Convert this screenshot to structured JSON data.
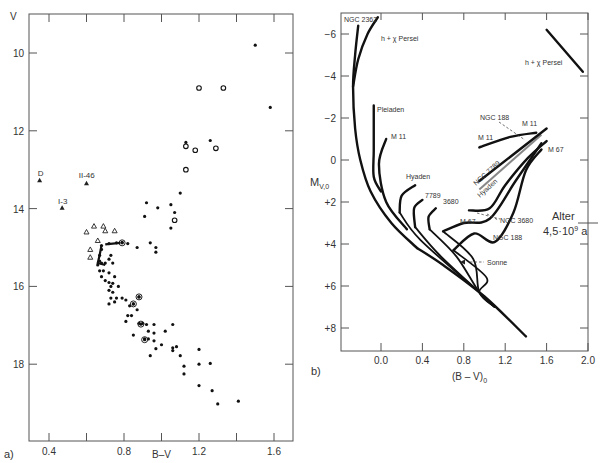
{
  "panels": {
    "a": {
      "label": "a)",
      "xlabel": "B–V",
      "ylabel": "V"
    },
    "b": {
      "label": "b)",
      "xlabel": "(B – V)",
      "xlabel_sub": "0",
      "ylabel": "M",
      "ylabel_sub": "V,0",
      "annotation_line1": "Alter",
      "annotation_line2": "4,5·10",
      "annotation_sup": "9",
      "annotation_unit": " a"
    }
  },
  "chart_data": [
    {
      "type": "scatter",
      "title": "a) Color-magnitude diagram",
      "xlabel": "B–V",
      "ylabel": "V",
      "xlim": [
        0.31,
        1.72
      ],
      "ylim": [
        20.0,
        9.0
      ],
      "y_inverted": true,
      "xticks": [
        0.4,
        0.6,
        0.8,
        1.0,
        1.2,
        1.4,
        1.6
      ],
      "xtick_labels": [
        "0.4",
        "",
        "0.8",
        "",
        "1.2",
        "",
        "1.6"
      ],
      "yticks": [
        10,
        12,
        14,
        16,
        18
      ],
      "ytick_labels": [
        "10",
        "12",
        "14",
        "16",
        "18"
      ],
      "grid": false,
      "annotations": [
        {
          "text": "D",
          "x": 0.35,
          "y": 13.3
        },
        {
          "text": "II-46",
          "x": 0.58,
          "y": 13.35
        },
        {
          "text": "I-3",
          "x": 0.48,
          "y": 14.0
        }
      ],
      "series": [
        {
          "name": "labeled triangles",
          "marker": "triangle-filled",
          "points": [
            [
              0.35,
              13.27
            ],
            [
              0.6,
              13.35
            ],
            [
              0.47,
              13.98
            ]
          ]
        },
        {
          "name": "open triangles",
          "marker": "triangle-open",
          "points": [
            [
              0.6,
              14.6
            ],
            [
              0.64,
              14.45
            ],
            [
              0.69,
              14.45
            ],
            [
              0.7,
              14.57
            ],
            [
              0.75,
              14.57
            ],
            [
              0.66,
              14.82
            ],
            [
              0.62,
              15.05
            ],
            [
              0.62,
              15.25
            ]
          ]
        },
        {
          "name": "open circles",
          "marker": "circle-open",
          "points": [
            [
              1.2,
              10.9
            ],
            [
              1.33,
              10.9
            ],
            [
              1.13,
              12.4
            ],
            [
              1.18,
              12.5
            ],
            [
              1.29,
              12.45
            ],
            [
              1.13,
              13.0
            ],
            [
              1.07,
              14.3
            ]
          ]
        },
        {
          "name": "filled dots",
          "marker": "dot",
          "points": [
            [
              1.5,
              9.8
            ],
            [
              1.58,
              11.4
            ],
            [
              1.13,
              12.3
            ],
            [
              1.26,
              12.25
            ],
            [
              1.1,
              13.6
            ],
            [
              0.92,
              13.85
            ],
            [
              0.98,
              13.98
            ],
            [
              1.05,
              13.9
            ],
            [
              1.07,
              14.1
            ],
            [
              0.91,
              14.2
            ],
            [
              1.05,
              14.5
            ],
            [
              0.68,
              14.95
            ],
            [
              0.72,
              14.9
            ],
            [
              0.76,
              14.88
            ],
            [
              0.79,
              14.87
            ],
            [
              0.82,
              14.9
            ],
            [
              0.87,
              15.0
            ],
            [
              0.94,
              14.88
            ],
            [
              0.97,
              15.0
            ],
            [
              0.97,
              15.12
            ],
            [
              0.68,
              15.05
            ],
            [
              0.67,
              15.2
            ],
            [
              0.67,
              15.35
            ],
            [
              0.66,
              15.45
            ],
            [
              0.68,
              15.4
            ],
            [
              0.7,
              15.4
            ],
            [
              0.72,
              15.3
            ],
            [
              0.73,
              15.2
            ],
            [
              0.74,
              15.4
            ],
            [
              0.67,
              15.6
            ],
            [
              0.69,
              15.6
            ],
            [
              0.72,
              15.65
            ],
            [
              0.68,
              15.75
            ],
            [
              0.7,
              15.85
            ],
            [
              0.72,
              15.9
            ],
            [
              0.74,
              15.92
            ],
            [
              0.75,
              15.75
            ],
            [
              0.73,
              16.0
            ],
            [
              0.77,
              16.0
            ],
            [
              0.72,
              16.1
            ],
            [
              0.74,
              16.15
            ],
            [
              0.73,
              16.3
            ],
            [
              0.76,
              16.3
            ],
            [
              0.79,
              16.3
            ],
            [
              0.72,
              16.45
            ],
            [
              0.75,
              16.4
            ],
            [
              0.81,
              16.35
            ],
            [
              0.83,
              16.5
            ],
            [
              0.85,
              16.45
            ],
            [
              0.87,
              16.6
            ],
            [
              0.88,
              16.27
            ],
            [
              0.82,
              16.75
            ],
            [
              0.84,
              16.75
            ],
            [
              0.81,
              16.9
            ],
            [
              0.88,
              16.95
            ],
            [
              0.9,
              16.95
            ],
            [
              0.92,
              16.98
            ],
            [
              0.96,
              16.98
            ],
            [
              0.93,
              17.15
            ],
            [
              0.96,
              17.2
            ],
            [
              1.02,
              17.15
            ],
            [
              1.06,
              16.98
            ],
            [
              0.85,
              17.25
            ],
            [
              0.91,
              17.35
            ],
            [
              0.93,
              17.35
            ],
            [
              0.96,
              17.4
            ],
            [
              0.97,
              17.6
            ],
            [
              1.0,
              17.5
            ],
            [
              1.06,
              17.58
            ],
            [
              1.06,
              17.65
            ],
            [
              1.08,
              17.55
            ],
            [
              1.1,
              17.78
            ],
            [
              0.94,
              17.78
            ],
            [
              1.2,
              17.62
            ],
            [
              1.26,
              17.98
            ],
            [
              1.2,
              18.0
            ],
            [
              1.12,
              18.05
            ],
            [
              1.12,
              18.25
            ],
            [
              1.2,
              18.55
            ],
            [
              1.27,
              18.68
            ],
            [
              1.3,
              19.02
            ],
            [
              1.41,
              18.95
            ]
          ]
        },
        {
          "name": "ringed dots",
          "marker": "circle-dot",
          "points": [
            [
              0.79,
              14.88
            ],
            [
              0.88,
              16.27
            ],
            [
              0.85,
              16.45
            ],
            [
              0.89,
              16.97
            ],
            [
              0.91,
              17.37
            ]
          ]
        }
      ]
    },
    {
      "type": "line",
      "title": "b) Color-magnitude diagram of open clusters",
      "xlabel": "(B–V)0",
      "ylabel": "MV,0",
      "xlim": [
        -0.38,
        2.0
      ],
      "ylim": [
        9.0,
        -7.0
      ],
      "y_inverted": true,
      "xticks": [
        0.0,
        0.4,
        0.8,
        1.2,
        1.6,
        2.0
      ],
      "xtick_labels": [
        "0.0",
        "0.4",
        "0.8",
        "1.2",
        "1.6",
        "2.0"
      ],
      "yticks": [
        -6,
        -4,
        -2,
        0,
        2,
        4,
        6,
        8
      ],
      "ytick_labels": [
        "-6",
        "-4",
        "-2",
        "0",
        "+2",
        "+4",
        "+6",
        "+8"
      ],
      "grid": false,
      "annotations": [
        {
          "text": "Alter 4,5·10^9 a",
          "y": 3.0,
          "position": "right axis"
        },
        {
          "text": "Sonne",
          "x": 0.65,
          "y": 4.8,
          "arrow": true
        }
      ],
      "series": [
        {
          "name": "NGC 2362",
          "points": [
            [
              -0.22,
              -6.4
            ],
            [
              -0.25,
              -5
            ],
            [
              -0.27,
              -3.5
            ],
            [
              -0.25,
              -1.5
            ],
            [
              -0.2,
              0
            ],
            [
              -0.1,
              1.5
            ],
            [
              0.1,
              3.0
            ],
            [
              0.35,
              4.2
            ]
          ]
        },
        {
          "name": "h + χ Persei",
          "points": [
            [
              -0.03,
              -6.8
            ],
            [
              -0.13,
              -6
            ],
            [
              -0.22,
              -4.8
            ],
            [
              -0.27,
              -3.5
            ]
          ]
        },
        {
          "name": "h + χ Persei (red)",
          "points": [
            [
              1.6,
              -6.2
            ],
            [
              1.95,
              -4.2
            ]
          ]
        },
        {
          "name": "Pleiaden",
          "points": [
            [
              -0.07,
              -2.6
            ],
            [
              -0.07,
              -0.5
            ],
            [
              -0.07,
              0.8
            ],
            [
              0.0,
              1.5
            ]
          ]
        },
        {
          "name": "M 11",
          "points": [
            [
              0.05,
              -1.0
            ],
            [
              -0.02,
              0.2
            ],
            [
              0.05,
              2.0
            ],
            [
              0.25,
              3.3
            ]
          ]
        },
        {
          "name": "M 11 (giants)",
          "points": [
            [
              0.95,
              -0.6
            ],
            [
              1.25,
              -1.1
            ],
            [
              1.5,
              -1.3
            ]
          ]
        },
        {
          "name": "Hyaden",
          "points": [
            [
              0.33,
              1.2
            ],
            [
              0.2,
              1.7
            ],
            [
              0.18,
              2.5
            ]
          ]
        },
        {
          "name": "Hyaden (giants)",
          "points": [
            [
              0.95,
              1.4
            ],
            [
              1.55,
              -1.2
            ]
          ]
        },
        {
          "name": "NGC 7789",
          "points": [
            [
              0.95,
              1.0
            ],
            [
              1.6,
              -1.5
            ]
          ]
        },
        {
          "name": "7789",
          "points": [
            [
              0.4,
              1.9
            ],
            [
              0.32,
              2.3
            ],
            [
              0.33,
              3.2
            ]
          ]
        },
        {
          "name": "3680",
          "points": [
            [
              0.53,
              2.3
            ],
            [
              0.46,
              2.7
            ],
            [
              0.47,
              3.3
            ]
          ]
        },
        {
          "name": "NGC 3680",
          "points": [
            [
              0.6,
              3.4
            ],
            [
              0.8,
              3.0
            ],
            [
              1.05,
              2.8
            ],
            [
              1.3,
              1.0
            ],
            [
              1.55,
              -0.8
            ]
          ]
        },
        {
          "name": "M 67",
          "points": [
            [
              0.85,
              2.4
            ],
            [
              1.05,
              2.3
            ],
            [
              1.2,
              1.2
            ],
            [
              1.42,
              -0.1
            ],
            [
              1.6,
              -0.9
            ]
          ]
        },
        {
          "name": "NGC 188",
          "points": [
            [
              0.7,
              4.3
            ],
            [
              0.9,
              3.5
            ],
            [
              1.1,
              3.9
            ],
            [
              1.28,
              2.5
            ],
            [
              1.4,
              0.5
            ],
            [
              1.55,
              -0.5
            ]
          ]
        },
        {
          "name": "ZAMS lower",
          "points": [
            [
              0.35,
              4.2
            ],
            [
              0.6,
              5.0
            ],
            [
              1.0,
              6.5
            ],
            [
              1.4,
              8.4
            ]
          ]
        }
      ]
    }
  ]
}
